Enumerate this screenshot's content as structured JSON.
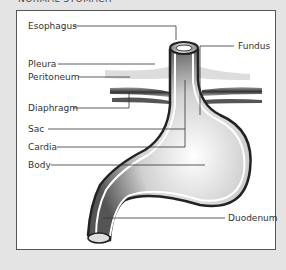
{
  "title": "NORMAL STOMACH",
  "labels": {
    "esophagus": "Esophagus",
    "pleura": "Pleura",
    "peritoneum": "Peritoneum",
    "diaphragm": "Diaphragm",
    "sac": "Sac",
    "cardia": "Cardia",
    "body": "Body",
    "fundus": "Fundus",
    "duodenum": "Duodenum"
  }
}
